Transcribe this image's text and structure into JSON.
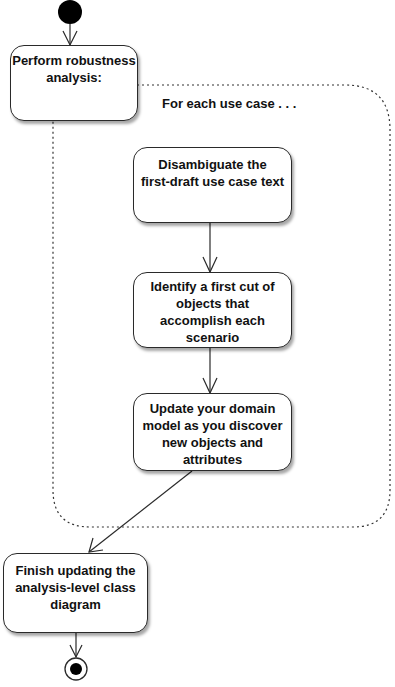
{
  "diagram": {
    "type": "UML activity diagram",
    "start_node": {
      "kind": "initial-node"
    },
    "end_node": {
      "kind": "final-node"
    },
    "activities": [
      {
        "id": "a1",
        "lines": [
          "Perform robustness",
          "analysis:"
        ]
      },
      {
        "id": "a2",
        "lines": [
          "Disambiguate the",
          "first-draft use case text"
        ]
      },
      {
        "id": "a3",
        "lines": [
          "Identify a first cut of",
          "objects that",
          "accomplish each",
          "scenario"
        ]
      },
      {
        "id": "a4",
        "lines": [
          "Update your domain",
          "model as you discover",
          "new objects and",
          "attributes"
        ]
      },
      {
        "id": "a5",
        "lines": [
          "Finish updating the",
          "analysis-level class",
          "diagram"
        ]
      }
    ],
    "region": {
      "kind": "expansion-region",
      "label": "For each use case . . ."
    },
    "flows": [
      {
        "from": "start",
        "to": "a1"
      },
      {
        "from": "a2",
        "to": "a3"
      },
      {
        "from": "a3",
        "to": "a4"
      },
      {
        "from": "a4",
        "to": "a5"
      },
      {
        "from": "a5",
        "to": "end"
      }
    ],
    "colors": {
      "stroke": "#2a2a2a",
      "fill": "#ffffff",
      "node_fill_dark": "#000000",
      "text": "#111111"
    }
  }
}
